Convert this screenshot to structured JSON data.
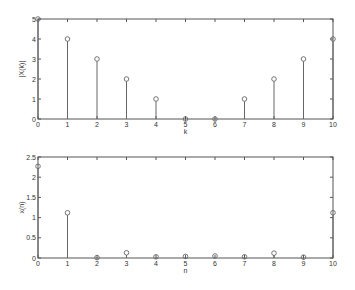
{
  "chart_data": [
    {
      "type": "stem",
      "title": "",
      "xlabel": "k",
      "ylabel": "|X(k)|",
      "xlim": [
        0,
        10
      ],
      "ylim": [
        0,
        5
      ],
      "xticks": [
        "0",
        "1",
        "2",
        "3",
        "4",
        "5",
        "6",
        "7",
        "8",
        "9",
        "10"
      ],
      "yticks": [
        "0",
        "1",
        "2",
        "3",
        "4",
        "5"
      ],
      "grid": false,
      "x": [
        0,
        1,
        2,
        3,
        4,
        5,
        6,
        7,
        8,
        9,
        10
      ],
      "values": [
        5,
        4,
        3,
        2,
        1,
        0,
        0,
        1,
        2,
        3,
        4
      ]
    },
    {
      "type": "stem",
      "title": "",
      "xlabel": "n",
      "ylabel": "x(n)",
      "xlim": [
        0,
        10
      ],
      "ylim": [
        0,
        2.5
      ],
      "xticks": [
        "0",
        "1",
        "2",
        "3",
        "4",
        "5",
        "6",
        "7",
        "8",
        "9",
        "10"
      ],
      "yticks": [
        "0",
        "0.5",
        "1",
        "1.5",
        "2",
        "2.5"
      ],
      "grid": false,
      "x": [
        0,
        1,
        2,
        3,
        4,
        5,
        6,
        7,
        8,
        9,
        10
      ],
      "values": [
        2.27,
        1.12,
        0.01,
        0.13,
        0.03,
        0.04,
        0.05,
        0.03,
        0.12,
        0.02,
        1.12
      ]
    }
  ],
  "plots": [
    {
      "xlabel": "k",
      "ylabel": "|X(k)|"
    },
    {
      "xlabel": "n",
      "ylabel": "x(n)"
    }
  ]
}
